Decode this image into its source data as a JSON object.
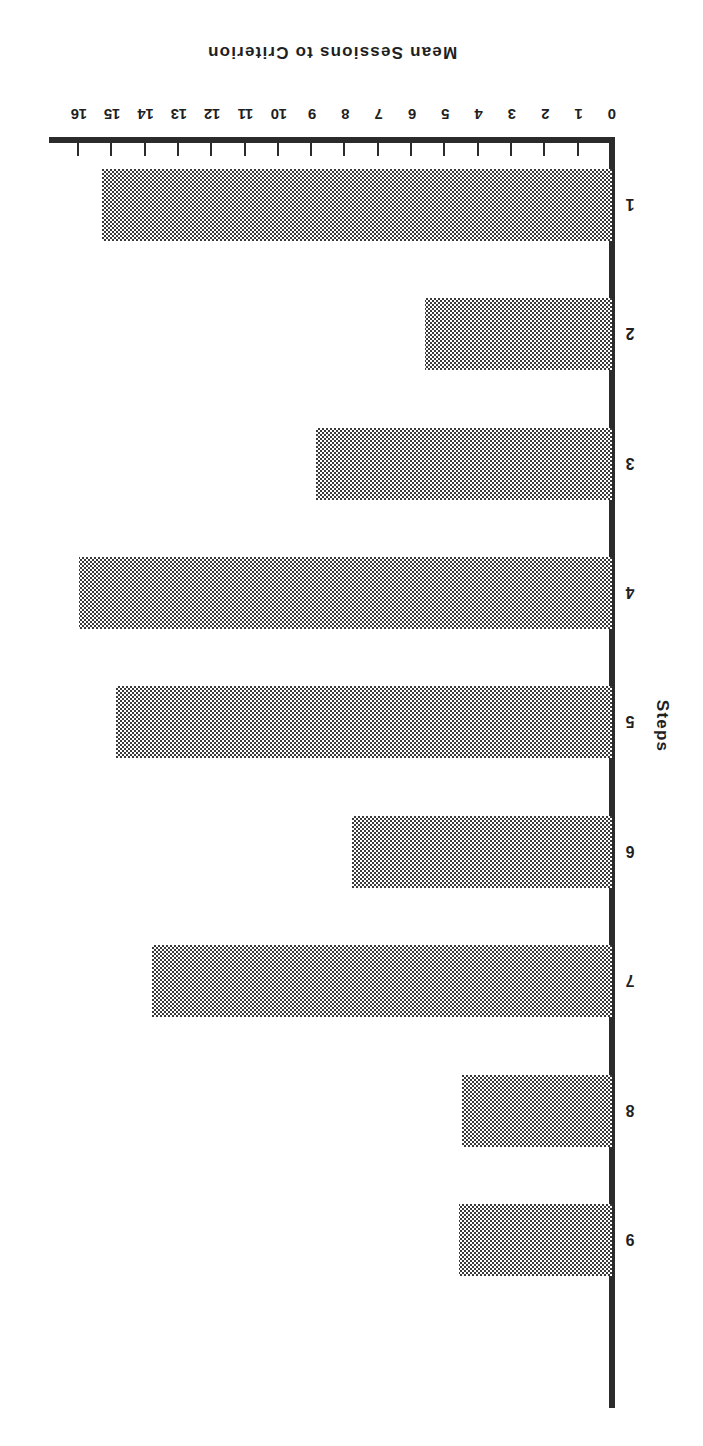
{
  "chart_data": {
    "type": "bar",
    "orientation": "horizontal",
    "title": "",
    "xlabel": "Mean Sessions to Criterion",
    "ylabel": "Steps",
    "categories": [
      "1",
      "2",
      "3",
      "4",
      "5",
      "6",
      "7",
      "8",
      "9"
    ],
    "values": [
      15.3,
      5.6,
      8.9,
      16.0,
      14.9,
      7.8,
      13.8,
      4.5,
      4.6
    ],
    "xlim": [
      0,
      16
    ],
    "xticks": [
      0,
      1,
      2,
      3,
      4,
      5,
      6,
      7,
      8,
      9,
      10,
      11,
      12,
      13,
      14,
      15,
      16
    ],
    "xtick_labels": [
      "0",
      "1",
      "2",
      "3",
      "4",
      "5",
      "6",
      "7",
      "8",
      "9",
      "10",
      "11",
      "12",
      "13",
      "14",
      "15",
      "16"
    ],
    "grid": false,
    "legend": null,
    "bar_fill": "checkerboard-dither-50-percent",
    "bar_color": "#3a3a3a",
    "axis_color": "#2b2b2b",
    "background_color": "#ffffff",
    "page_rotation_degrees": 180
  }
}
